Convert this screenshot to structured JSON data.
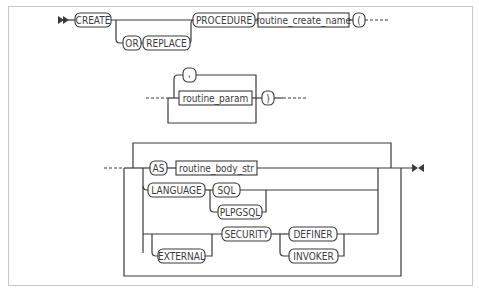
{
  "diagram": {
    "colors": {
      "stroke": "#3a3a3a",
      "background": "#ffffff",
      "frame": "#c8c8c8"
    },
    "row1": {
      "start_marker": "double-arrow-start",
      "create": "CREATE",
      "or": "OR",
      "replace": "REPLACE",
      "procedure": "PROCEDURE",
      "routine_create_name": "routine_create_name",
      "open_paren": "("
    },
    "row2": {
      "comma": ",",
      "routine_param": "routine_param",
      "close_paren": ")"
    },
    "row3": {
      "as": "AS",
      "routine_body_str": "routine_body_str",
      "language": "LANGUAGE",
      "sql": "SQL",
      "plpgsql": "PLPGSQL",
      "external": "EXTERNAL",
      "security": "SECURITY",
      "definer": "DEFINER",
      "invoker": "INVOKER",
      "end_marker": "end-marker"
    }
  }
}
